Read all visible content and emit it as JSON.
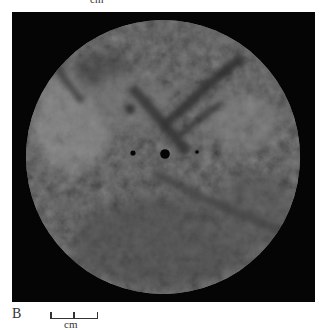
{
  "figure": {
    "top_partial_label": "cm",
    "panel_label": "B",
    "scale_bar": {
      "unit_label": "cm"
    },
    "colors": {
      "background_panel": "#050505",
      "disc_base": "#6b6b6b",
      "disc_dark_veins": "#3a3a3a",
      "disc_light_patches": "#8a8a8a",
      "holes": "#050505",
      "text": "#333333"
    }
  }
}
